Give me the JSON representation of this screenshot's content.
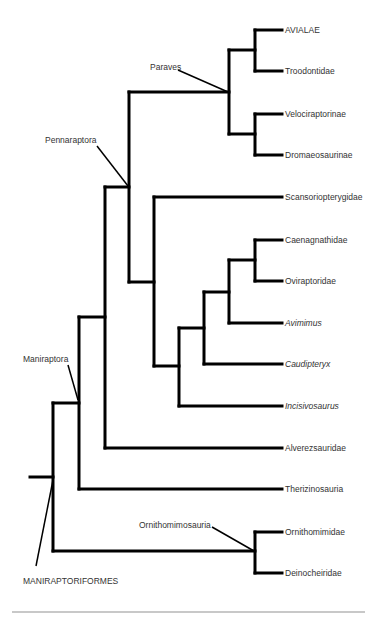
{
  "diagram": {
    "type": "cladogram",
    "tip_x": 282,
    "label_x": 285,
    "taxa": [
      {
        "id": "avialae",
        "label": "AVIALAE",
        "y": 30,
        "italic": false
      },
      {
        "id": "troodontidae",
        "label": "Troodontidae",
        "y": 71,
        "italic": false
      },
      {
        "id": "velociraptorinae",
        "label": "Velociraptorinae",
        "y": 114,
        "italic": false
      },
      {
        "id": "dromaeosaurinae",
        "label": "Dromaeosaurinae",
        "y": 155,
        "italic": false
      },
      {
        "id": "scansoriopterygidae",
        "label": "Scansoriopterygidae",
        "y": 197,
        "italic": false
      },
      {
        "id": "caenagnathidae",
        "label": "Caenagnathidae",
        "y": 240,
        "italic": false
      },
      {
        "id": "oviraptoridae",
        "label": "Oviraptoridae",
        "y": 281,
        "italic": false
      },
      {
        "id": "avimimus",
        "label": "Avimimus",
        "y": 323,
        "italic": true
      },
      {
        "id": "caudipteryx",
        "label": "Caudipteryx",
        "y": 364,
        "italic": true
      },
      {
        "id": "incisivosaurus",
        "label": "Incisivosaurus",
        "y": 406,
        "italic": true
      },
      {
        "id": "alverezsauridae",
        "label": "Alverezsauridae",
        "y": 448,
        "italic": false
      },
      {
        "id": "therizinosauria",
        "label": "Therizinosauria",
        "y": 489,
        "italic": false
      },
      {
        "id": "ornithomimidae",
        "label": "Ornithomimidae",
        "y": 532,
        "italic": false
      },
      {
        "id": "deinocheiridae",
        "label": "Deinocheiridae",
        "y": 573,
        "italic": false
      }
    ],
    "nodes": [
      {
        "id": "avialae-troodontidae",
        "x": 255,
        "y1": 30,
        "y2": 71,
        "children": [
          {
            "to_x": 282,
            "y": 30
          },
          {
            "to_x": 282,
            "y": 71
          }
        ]
      },
      {
        "id": "dromaeosauridae",
        "x": 255,
        "y1": 114,
        "y2": 155,
        "children": [
          {
            "to_x": 282,
            "y": 114
          },
          {
            "to_x": 282,
            "y": 155
          }
        ]
      },
      {
        "id": "paraves",
        "x": 229,
        "y1": 50,
        "y2": 134,
        "children": [
          {
            "to_x": 255,
            "y": 50
          },
          {
            "to_x": 255,
            "y": 134
          }
        ]
      },
      {
        "id": "caen-ovi",
        "x": 255,
        "y1": 240,
        "y2": 281,
        "children": [
          {
            "to_x": 282,
            "y": 240
          },
          {
            "to_x": 282,
            "y": 281
          }
        ]
      },
      {
        "id": "caen-ovi-avimimus",
        "x": 229,
        "y1": 260,
        "y2": 323,
        "children": [
          {
            "to_x": 255,
            "y": 260
          },
          {
            "to_x": 282,
            "y": 323
          }
        ]
      },
      {
        "id": "with-caudipteryx",
        "x": 204,
        "y1": 292,
        "y2": 364,
        "children": [
          {
            "to_x": 229,
            "y": 292
          },
          {
            "to_x": 282,
            "y": 364
          }
        ]
      },
      {
        "id": "oviraptorosauria",
        "x": 179,
        "y1": 328,
        "y2": 406,
        "children": [
          {
            "to_x": 204,
            "y": 328
          },
          {
            "to_x": 282,
            "y": 406
          }
        ]
      },
      {
        "id": "scansor-ovi",
        "x": 154,
        "y1": 197,
        "y2": 366,
        "children": [
          {
            "to_x": 282,
            "y": 197
          },
          {
            "to_x": 179,
            "y": 366
          }
        ]
      },
      {
        "id": "pennaraptora",
        "x": 129,
        "y1": 92,
        "y2": 282,
        "children": [
          {
            "to_x": 229,
            "y": 92
          },
          {
            "to_x": 154,
            "y": 282
          }
        ]
      },
      {
        "id": "penna-alvarez",
        "x": 105,
        "y1": 187,
        "y2": 448,
        "children": [
          {
            "to_x": 129,
            "y": 187
          },
          {
            "to_x": 282,
            "y": 448
          }
        ]
      },
      {
        "id": "maniraptora",
        "x": 79,
        "y1": 317,
        "y2": 489,
        "children": [
          {
            "to_x": 105,
            "y": 317
          },
          {
            "to_x": 282,
            "y": 489
          }
        ]
      },
      {
        "id": "ornithomimosauria",
        "x": 255,
        "y1": 532,
        "y2": 573,
        "children": [
          {
            "to_x": 282,
            "y": 532
          },
          {
            "to_x": 282,
            "y": 573
          }
        ]
      },
      {
        "id": "maniraptoriformes",
        "x": 53,
        "y1": 403,
        "y2": 551,
        "children": [
          {
            "to_x": 79,
            "y": 403
          },
          {
            "to_x": 255,
            "y": 551
          }
        ]
      }
    ],
    "root_stem": {
      "x1": 30,
      "x2": 53,
      "y": 477
    },
    "clade_labels": [
      {
        "id": "paraves",
        "label": "Paraves",
        "x": 150,
        "y": 70,
        "anchor": "start",
        "pointer": {
          "x1": 178,
          "y1": 70,
          "x2": 228,
          "y2": 92
        }
      },
      {
        "id": "pennaraptora",
        "label": "Pennaraptora",
        "x": 45,
        "y": 143,
        "anchor": "start",
        "pointer": {
          "x1": 97,
          "y1": 146,
          "x2": 128,
          "y2": 186
        }
      },
      {
        "id": "maniraptora",
        "label": "Maniraptora",
        "x": 23,
        "y": 362,
        "anchor": "start",
        "pointer": {
          "x1": 68,
          "y1": 365,
          "x2": 78,
          "y2": 400
        }
      },
      {
        "id": "ornithomimosauria",
        "label": "Ornithomimosauria",
        "x": 139,
        "y": 528,
        "anchor": "start",
        "pointer": {
          "x1": 212,
          "y1": 527,
          "x2": 254,
          "y2": 551
        }
      },
      {
        "id": "maniraptoriformes",
        "label": "MANIRAPTORIFORMES",
        "x": 23,
        "y": 584,
        "anchor": "start",
        "pointer": {
          "x1": 36,
          "y1": 566,
          "x2": 53,
          "y2": 480
        }
      }
    ],
    "footer_rule": {
      "x1": 12,
      "x2": 365,
      "y": 612,
      "color": "#c8c8c8"
    }
  },
  "colors": {
    "branch": "#000000",
    "label_text": "#333333",
    "background": "#ffffff"
  }
}
